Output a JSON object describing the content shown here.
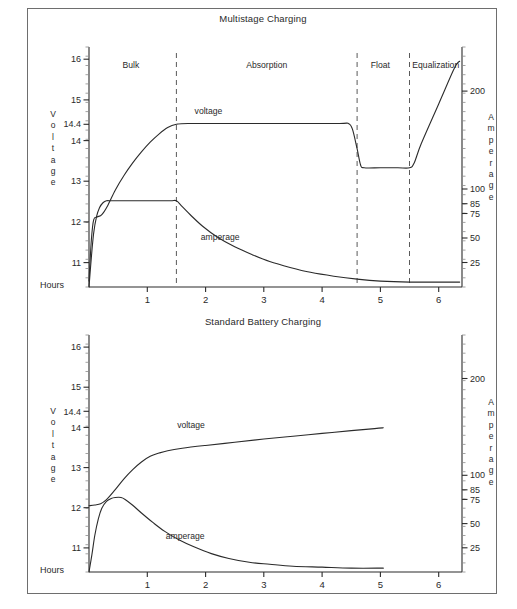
{
  "figure": {
    "background": "#ffffff",
    "line_color": "#2b2b2b",
    "dash_color": "#5a5a5a",
    "border_color": "#6e6e6e"
  },
  "charts": [
    {
      "id": "multistage",
      "title": "Multistage Charging",
      "x_axis_name": "Hours",
      "left_axis_word": "Voltage",
      "right_axis_word": "Amperage",
      "x_ticks": [
        "1",
        "2",
        "3",
        "4",
        "5",
        "6"
      ],
      "y_left_ticks": [
        "16",
        "15",
        "14.4",
        "14",
        "13",
        "12",
        "11"
      ],
      "y_right_ticks": [
        "200",
        "100",
        "85",
        "75",
        "50",
        "25"
      ],
      "stages": [
        "Bulk",
        "Absorption",
        "Float",
        "Equalization"
      ],
      "series_labels": {
        "voltage": "voltage",
        "amperage": "amperage"
      }
    },
    {
      "id": "standard",
      "title": "Standard Battery Charging",
      "x_axis_name": "Hours",
      "left_axis_word": "Voltage",
      "right_axis_word": "Amperage",
      "x_ticks": [
        "1",
        "2",
        "3",
        "4",
        "5",
        "6"
      ],
      "y_left_ticks": [
        "16",
        "15",
        "14.4",
        "14",
        "13",
        "12",
        "11"
      ],
      "y_right_ticks": [
        "200",
        "100",
        "85",
        "75",
        "50",
        "25"
      ],
      "series_labels": {
        "voltage": "voltage",
        "amperage": "amperage"
      }
    }
  ],
  "chart_data": [
    {
      "type": "line",
      "title": "Multistage Charging",
      "xlabel": "Hours",
      "ylabel": "Voltage",
      "y2label": "Amperage",
      "xlim": [
        0,
        6.4
      ],
      "ylim": [
        10.4,
        16.3
      ],
      "y2lim": [
        0,
        245
      ],
      "grid": false,
      "legend": "inline-annotations",
      "x_ticks": [
        1,
        2,
        3,
        4,
        5,
        6
      ],
      "y_ticks": [
        11,
        12,
        13,
        14,
        14.4,
        15,
        16
      ],
      "y2_ticks": [
        25,
        50,
        75,
        85,
        100,
        200
      ],
      "stage_boundaries_hours": [
        1.5,
        4.6,
        5.5
      ],
      "annotations": [
        {
          "text": "Bulk",
          "x": 0.72,
          "y": 15.85
        },
        {
          "text": "Absorption",
          "x": 3.05,
          "y": 15.85
        },
        {
          "text": "Float",
          "x": 5.0,
          "y": 15.85
        },
        {
          "text": "Equalization",
          "x": 5.95,
          "y": 15.85
        },
        {
          "text": "voltage",
          "x": 2.05,
          "y": 14.72
        },
        {
          "text": "amperage",
          "x": 2.25,
          "y": 11.62
        }
      ],
      "series": [
        {
          "name": "voltage",
          "axis": "left",
          "units": "V",
          "points": [
            [
              0.0,
              10.55
            ],
            [
              0.04,
              11.55
            ],
            [
              0.08,
              12.05
            ],
            [
              0.14,
              12.12
            ],
            [
              0.22,
              12.18
            ],
            [
              0.32,
              12.4
            ],
            [
              0.45,
              12.78
            ],
            [
              0.6,
              13.14
            ],
            [
              0.75,
              13.45
            ],
            [
              0.9,
              13.72
            ],
            [
              1.05,
              13.96
            ],
            [
              1.2,
              14.16
            ],
            [
              1.35,
              14.32
            ],
            [
              1.5,
              14.4
            ],
            [
              1.7,
              14.42
            ],
            [
              2.5,
              14.42
            ],
            [
              3.5,
              14.42
            ],
            [
              4.3,
              14.42
            ],
            [
              4.45,
              14.42
            ],
            [
              4.52,
              14.28
            ],
            [
              4.6,
              13.8
            ],
            [
              4.66,
              13.4
            ],
            [
              4.72,
              13.33
            ],
            [
              5.0,
              13.33
            ],
            [
              5.3,
              13.33
            ],
            [
              5.5,
              13.33
            ],
            [
              5.58,
              13.45
            ],
            [
              5.7,
              13.92
            ],
            [
              6.0,
              14.9
            ],
            [
              6.25,
              15.72
            ],
            [
              6.32,
              15.9
            ],
            [
              6.36,
              15.95
            ]
          ]
        },
        {
          "name": "amperage",
          "axis": "right",
          "units": "A",
          "points": [
            [
              0.0,
              0
            ],
            [
              0.04,
              30
            ],
            [
              0.08,
              55
            ],
            [
              0.13,
              72
            ],
            [
              0.18,
              81
            ],
            [
              0.24,
              86
            ],
            [
              0.3,
              88
            ],
            [
              0.4,
              88
            ],
            [
              0.7,
              88
            ],
            [
              1.1,
              88
            ],
            [
              1.4,
              88
            ],
            [
              1.5,
              88
            ],
            [
              1.6,
              82
            ],
            [
              1.75,
              73
            ],
            [
              1.95,
              62
            ],
            [
              2.2,
              51
            ],
            [
              2.5,
              41
            ],
            [
              2.8,
              33
            ],
            [
              3.1,
              26
            ],
            [
              3.45,
              20
            ],
            [
              3.8,
              15
            ],
            [
              4.2,
              11
            ],
            [
              4.6,
              8
            ],
            [
              5.0,
              6
            ],
            [
              5.5,
              5
            ],
            [
              6.0,
              5
            ],
            [
              6.36,
              5
            ]
          ]
        }
      ]
    },
    {
      "type": "line",
      "title": "Standard Battery Charging",
      "xlabel": "Hours",
      "ylabel": "Voltage",
      "y2label": "Amperage",
      "xlim": [
        0,
        6.4
      ],
      "ylim": [
        10.4,
        16.3
      ],
      "y2lim": [
        0,
        245
      ],
      "grid": false,
      "legend": "inline-annotations",
      "x_ticks": [
        1,
        2,
        3,
        4,
        5,
        6
      ],
      "y_ticks": [
        11,
        12,
        13,
        14,
        14.4,
        15,
        16
      ],
      "y2_ticks": [
        25,
        50,
        75,
        85,
        100,
        200
      ],
      "annotations": [
        {
          "text": "voltage",
          "x": 1.75,
          "y": 14.05
        },
        {
          "text": "amperage",
          "x": 1.65,
          "y": 11.3
        }
      ],
      "series": [
        {
          "name": "voltage",
          "axis": "left",
          "units": "V",
          "points": [
            [
              0.0,
              12.05
            ],
            [
              0.1,
              12.07
            ],
            [
              0.2,
              12.1
            ],
            [
              0.3,
              12.2
            ],
            [
              0.45,
              12.45
            ],
            [
              0.6,
              12.72
            ],
            [
              0.75,
              12.95
            ],
            [
              0.9,
              13.14
            ],
            [
              1.05,
              13.28
            ],
            [
              1.2,
              13.36
            ],
            [
              1.35,
              13.42
            ],
            [
              1.6,
              13.48
            ],
            [
              2.0,
              13.55
            ],
            [
              2.5,
              13.63
            ],
            [
              3.0,
              13.71
            ],
            [
              3.5,
              13.78
            ],
            [
              4.0,
              13.85
            ],
            [
              4.5,
              13.92
            ],
            [
              4.9,
              13.97
            ],
            [
              5.05,
              13.99
            ]
          ]
        },
        {
          "name": "amperage",
          "axis": "right",
          "units": "A",
          "points": [
            [
              0.0,
              0
            ],
            [
              0.05,
              18
            ],
            [
              0.1,
              38
            ],
            [
              0.16,
              55
            ],
            [
              0.22,
              66
            ],
            [
              0.3,
              73
            ],
            [
              0.38,
              76
            ],
            [
              0.45,
              77
            ],
            [
              0.55,
              77
            ],
            [
              0.62,
              75
            ],
            [
              0.75,
              69
            ],
            [
              0.9,
              61
            ],
            [
              1.1,
              51
            ],
            [
              1.3,
              42
            ],
            [
              1.55,
              33
            ],
            [
              1.8,
              26
            ],
            [
              2.1,
              19
            ],
            [
              2.4,
              14
            ],
            [
              2.75,
              10
            ],
            [
              3.1,
              8
            ],
            [
              3.5,
              6
            ],
            [
              4.0,
              5
            ],
            [
              4.5,
              4
            ],
            [
              5.05,
              4
            ]
          ]
        }
      ]
    }
  ]
}
